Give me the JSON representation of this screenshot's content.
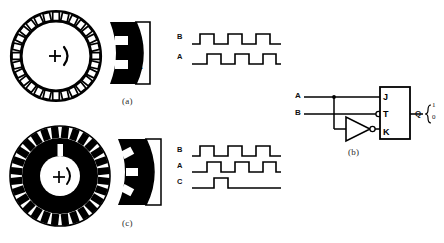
{
  "figure": {
    "ink_color": "#000000",
    "paper_color": "#ffffff"
  },
  "panels": [
    {
      "id": "a",
      "caption": "(a)",
      "disk": {
        "style": "outline",
        "teeth": 28,
        "hub_marker": "+",
        "rotation_arrow": ")"
      },
      "sensor_head": {
        "windows": [
          {
            "label": "B",
            "position": "upper"
          },
          {
            "label": "A",
            "position": "lower"
          }
        ]
      },
      "waveforms": {
        "traces": [
          {
            "label": "B",
            "pattern": "square",
            "phase_deg": 0
          },
          {
            "label": "A",
            "pattern": "square",
            "phase_deg": 90
          }
        ]
      }
    },
    {
      "id": "b",
      "caption": "(b)",
      "circuit": {
        "inputs": [
          {
            "label": "A"
          },
          {
            "label": "B"
          }
        ],
        "gate": {
          "type": "inverter",
          "bubble": true
        },
        "flipflop": {
          "type": "JK",
          "pins": [
            "J",
            "T",
            "K"
          ],
          "clock_pin": "T",
          "clock_inverted": true
        },
        "output": {
          "label": "Q",
          "levels": [
            "1",
            "0"
          ]
        }
      }
    },
    {
      "id": "c",
      "caption": "(c)",
      "disk": {
        "style": "filled",
        "teeth": 28,
        "index_slot": true,
        "hub_marker": "+",
        "rotation_arrow": ")"
      },
      "sensor_head": {
        "windows": [
          {
            "label": "B",
            "position": "upper"
          },
          {
            "label": "C",
            "position": "middle"
          },
          {
            "label": "A",
            "position": "lower"
          }
        ]
      },
      "waveforms": {
        "traces": [
          {
            "label": "B",
            "pattern": "square",
            "phase_deg": 0
          },
          {
            "label": "A",
            "pattern": "square",
            "phase_deg": 90
          },
          {
            "label": "C",
            "pattern": "index-pulse",
            "phase_deg": 0
          }
        ]
      }
    }
  ]
}
